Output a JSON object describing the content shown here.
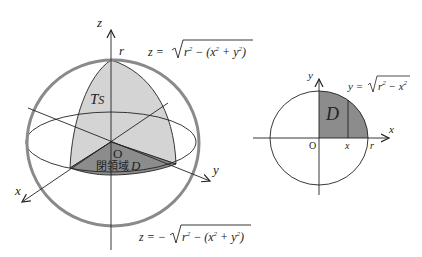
{
  "colors": {
    "sphere_outline": "#8a8a8a",
    "upper_region_fill": "#d4d4d4",
    "domain_fill": "#8c8c8c",
    "line": "#222222",
    "background": "#ffffff"
  },
  "left_diagram": {
    "axis_labels": {
      "z": "z",
      "x": "x",
      "y": "y"
    },
    "radius_label": "r",
    "surface_label_T": "T",
    "surface_label_S": "S",
    "origin_label": "O",
    "region_label_text": "閉領域",
    "region_label_var": "D",
    "upper_equation": {
      "lhs": "z = ",
      "sign": "",
      "radicand_prefix": "r",
      "radicand_rest": " − (x",
      "plus_part": " + y",
      "close": ")"
    },
    "lower_equation": {
      "lhs": "z = −",
      "radicand_prefix": "r",
      "radicand_rest": " − (x",
      "plus_part": " + y",
      "close": ")"
    },
    "exponent": "2"
  },
  "right_diagram": {
    "axis_labels": {
      "x": "x",
      "y": "y"
    },
    "origin_label": "O",
    "x_tick_label": "x",
    "r_tick_label": "r",
    "region_label": "D",
    "equation": {
      "lhs": "y = ",
      "radicand_a": "r",
      "radicand_b": " − x",
      "exponent": "2"
    }
  }
}
